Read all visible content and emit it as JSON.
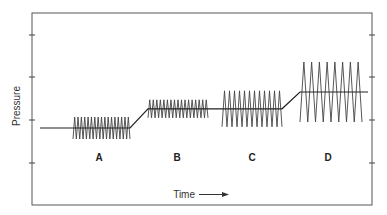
{
  "chart_data": {
    "type": "line",
    "title": "",
    "xlabel": "Time",
    "ylabel": "Pressure",
    "grid": false,
    "y_ticks_count": 4,
    "segments": [
      {
        "label": "A",
        "mean_level": 1.0,
        "amplitude": 0.55,
        "cycles": 17,
        "description": "small amplitude, high frequency oscillation at low mean"
      },
      {
        "label": "B",
        "mean_level": 1.4,
        "amplitude": 0.45,
        "cycles": 17,
        "description": "small amplitude, high frequency oscillation at raised mean"
      },
      {
        "label": "C",
        "mean_level": 1.4,
        "amplitude": 0.9,
        "cycles": 12,
        "description": "larger amplitude, medium frequency oscillation at same mean as B"
      },
      {
        "label": "D",
        "mean_level": 1.75,
        "amplitude": 1.5,
        "cycles": 8,
        "description": "large amplitude, low frequency oscillation at higher mean"
      }
    ],
    "ylim": [
      0,
      4.5
    ],
    "xlim": [
      0,
      4
    ]
  },
  "labels": {
    "x_axis": "Time",
    "y_axis": "Pressure",
    "time_arrow": "arrow-right"
  }
}
